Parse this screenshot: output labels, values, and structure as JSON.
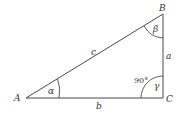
{
  "diagram": {
    "type": "right-triangle",
    "vertices": [
      {
        "name": "A",
        "x": 26,
        "y": 98
      },
      {
        "name": "B",
        "x": 163,
        "y": 14
      },
      {
        "name": "C",
        "x": 163,
        "y": 98
      }
    ],
    "labels": {
      "vertex_A": "A",
      "vertex_B": "B",
      "vertex_C": "C",
      "side_a": "a",
      "side_b": "b",
      "side_c": "c",
      "angle_alpha": "α",
      "angle_beta": "β",
      "angle_gamma": "γ",
      "right_angle": "90°"
    },
    "colors": {
      "stroke": "#333333",
      "background": "#ffffff"
    }
  }
}
